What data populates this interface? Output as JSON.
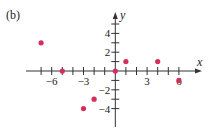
{
  "panel_label": "(b)",
  "colors": {
    "axis": "#333333",
    "point": "#d62e5c",
    "text": "#222222"
  },
  "chart_data": {
    "type": "scatter",
    "title": "",
    "xlabel": "x",
    "ylabel": "y",
    "xlim": [
      -7,
      6
    ],
    "ylim": [
      -5,
      5
    ],
    "grid": false,
    "x_tick_labels": [
      {
        "value": -6,
        "label": "−6"
      },
      {
        "value": -3,
        "label": "−3"
      },
      {
        "value": 3,
        "label": "3"
      },
      {
        "value": 6,
        "label": "6"
      }
    ],
    "y_tick_labels": [
      {
        "value": 4,
        "label": "4"
      },
      {
        "value": 2,
        "label": "2"
      },
      {
        "value": -2,
        "label": "−2"
      },
      {
        "value": -4,
        "label": "−4"
      }
    ],
    "points": [
      {
        "x": -7,
        "y": 3
      },
      {
        "x": -5,
        "y": 0
      },
      {
        "x": 0,
        "y": 0
      },
      {
        "x": 1,
        "y": 1
      },
      {
        "x": 4,
        "y": 1
      },
      {
        "x": 6,
        "y": -1
      },
      {
        "x": -2,
        "y": -3
      },
      {
        "x": -3,
        "y": -4
      }
    ]
  }
}
